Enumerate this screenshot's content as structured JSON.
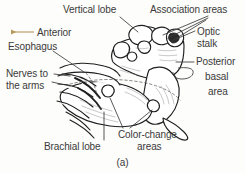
{
  "figure": {
    "caption": "(a)",
    "background_color": "#fdfdfb",
    "ink_color": "#2b2b2b",
    "label_color": "#3a3a3a",
    "arrow_color": "#b99a5e"
  },
  "direction_marker": {
    "label": "Anterior",
    "icon": "left-arrow-icon",
    "color": "#b99a5e"
  },
  "labels": [
    {
      "id": "vertical-lobe",
      "text": "Vertical lobe",
      "x": 63,
      "y": 4,
      "align": "left"
    },
    {
      "id": "association-areas",
      "text": "Association areas",
      "x": 150,
      "y": 4,
      "align": "left"
    },
    {
      "id": "anterior",
      "text": "Anterior",
      "x": 37,
      "y": 28,
      "align": "left"
    },
    {
      "id": "optic-stalk",
      "text": "Optic\nstalk",
      "x": 197,
      "y": 27,
      "align": "left"
    },
    {
      "id": "esophagus",
      "text": "Esophagus",
      "x": 8,
      "y": 42,
      "align": "left"
    },
    {
      "id": "posterior",
      "text": "Posterior",
      "x": 196,
      "y": 58,
      "align": "left"
    },
    {
      "id": "basal",
      "text": "basal",
      "x": 205,
      "y": 73,
      "align": "left"
    },
    {
      "id": "nerves-to-arms",
      "text": "Nerves to\nthe arms",
      "x": 6,
      "y": 70,
      "align": "left"
    },
    {
      "id": "area",
      "text": "area",
      "x": 208,
      "y": 88,
      "align": "left"
    },
    {
      "id": "color-change",
      "text": "Color-change",
      "x": 118,
      "y": 131,
      "align": "left"
    },
    {
      "id": "areas",
      "text": "areas",
      "x": 137,
      "y": 143,
      "align": "left"
    },
    {
      "id": "brachial-lobe",
      "text": "Brachial lobe",
      "x": 44,
      "y": 143,
      "align": "left"
    }
  ],
  "anatomy_parts": [
    "vertical lobe",
    "association areas",
    "optic stalk",
    "posterior basal area",
    "esophagus",
    "nerves to the arms",
    "brachial lobe",
    "color-change areas"
  ]
}
